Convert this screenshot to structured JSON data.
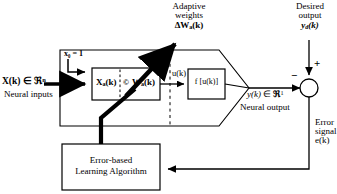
{
  "diagram": {
    "colors": {
      "stroke": "#000000",
      "background": "#ffffff"
    },
    "labels": {
      "adaptive_weights_line1": "Adaptive",
      "adaptive_weights_line2": "weights",
      "adaptive_weights_symbol_delta": "Δ",
      "adaptive_weights_symbol_w": "W",
      "adaptive_weights_symbol_sub": "a",
      "adaptive_weights_symbol_tail": "(k)",
      "desired_output_line1": "Desired",
      "desired_output_line2": "output",
      "desired_output_symbol_y": "y",
      "desired_output_symbol_sub": "d",
      "desired_output_symbol_tail": "(k)",
      "bias_label": "x₀  =  1",
      "input_symbol_x": "X(k)",
      "input_symbol_in": "∈",
      "input_symbol_set": "ℜ",
      "input_symbol_sup": "n",
      "input_caption": "Neural inputs",
      "weights_box_xa": "X",
      "weights_box_xa_sub": "a",
      "weights_box_xa_tail": "(k)",
      "weights_box_operator": "©",
      "weights_box_wa": "W",
      "weights_box_wa_sub": "a",
      "weights_box_wa_tail": "(k)",
      "u_label": "u(k)",
      "activation_box": "f [u(k)]",
      "output_symbol_y": "y(k)",
      "output_symbol_in": "∈",
      "output_symbol_set": "ℜ",
      "output_symbol_sup": "1",
      "output_caption": "Neural output",
      "sum_plus": "+",
      "sum_minus": "−",
      "error_line1": "Error",
      "error_line2": "signal",
      "error_line3": "e(k)",
      "learning_box_line1": "Error-based",
      "learning_box_line2": "Learning Algorithm"
    },
    "icons": {
      "arrow_head": "arrow-head-icon",
      "summing_junction": "summing-junction-icon",
      "dashed_divider": "dashed-divider-icon"
    }
  }
}
